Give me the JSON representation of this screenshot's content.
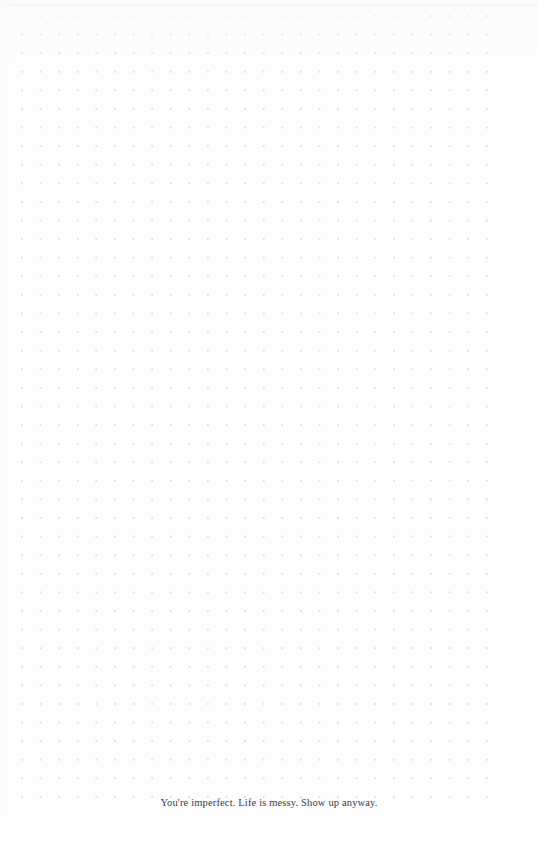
{
  "page": {
    "background_color": "#fdfdfd",
    "width": 538,
    "height": 842
  },
  "grid": {
    "name": "dot-grid",
    "dot_color": "#e1e1e4",
    "spacing_px": 18.6,
    "dot_radius_px": 1.0,
    "first_dot_x": 22,
    "first_dot_y": 16,
    "columns": 26,
    "rows": 43
  },
  "rule": {
    "name": "top-rule",
    "color": "#e9e9ec",
    "y": 4
  },
  "quote": {
    "text": "You're imperfect. Life is messy. Show up anyway.",
    "color": "#3a3a3e",
    "align": "center"
  }
}
